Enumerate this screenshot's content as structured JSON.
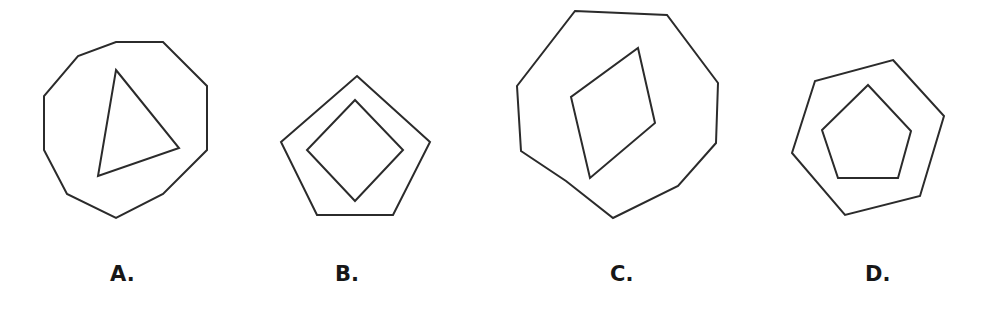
{
  "page": {
    "width": 986,
    "height": 317,
    "background_color": "#ffffff",
    "stroke_color": "#2b2b2b",
    "stroke_width": 2,
    "label_color": "#171717"
  },
  "question_figure": {
    "kind": "multiple-choice-geometry-figure",
    "description": "Four answer choices, each showing a small polygon nested inside a larger polygon.",
    "option_count": 4
  },
  "options": [
    {
      "key": "A",
      "label": "A.",
      "label_x": 110,
      "label_y": 285,
      "outer_shape": {
        "name": "octagon",
        "sides": 8,
        "points": "116,42 163,42 207,86 207,150 163,194 116,218 67,194 44,150 44,96 78,56"
      },
      "inner_shape": {
        "name": "triangle",
        "sides": 3,
        "points": "116,70 179,148 98,176"
      }
    },
    {
      "key": "B",
      "label": "B.",
      "label_x": 335,
      "label_y": 285,
      "outer_shape": {
        "name": "pentagon",
        "sides": 5,
        "points": "357,76 430,142 393,215 317,215 281,142"
      },
      "inner_shape": {
        "name": "diamond",
        "sides": 4,
        "points": "355,100 403,150 355,201 307,150"
      }
    },
    {
      "key": "C",
      "label": "C.",
      "label_x": 610,
      "label_y": 285,
      "outer_shape": {
        "name": "octagon",
        "sides": 8,
        "points": "575,11 667,15 718,83 716,143 678,186 613,218 566,181 521,151 517,86"
      },
      "inner_shape": {
        "name": "rhombus",
        "sides": 4,
        "points": "638,48 655,123 590,178 571,97"
      }
    },
    {
      "key": "D",
      "label": "D.",
      "label_x": 865,
      "label_y": 285,
      "outer_shape": {
        "name": "hexagon",
        "sides": 6,
        "points": "893,60 944,116 920,196 845,215 792,153 815,81"
      },
      "inner_shape": {
        "name": "pentagon",
        "sides": 5,
        "points": "868,85 911,131 898,178 838,178 822,130"
      }
    }
  ],
  "chart_data": {
    "type": "table",
    "categories": [
      "A",
      "B",
      "C",
      "D"
    ],
    "columns": [
      "option",
      "outer_polygon",
      "outer_sides",
      "inner_polygon",
      "inner_sides"
    ],
    "rows": [
      [
        "A",
        "octagon",
        8,
        "triangle",
        3
      ],
      [
        "B",
        "pentagon",
        5,
        "diamond",
        4
      ],
      [
        "C",
        "octagon",
        8,
        "rhombus",
        4
      ],
      [
        "D",
        "hexagon",
        6,
        "pentagon",
        5
      ]
    ]
  }
}
